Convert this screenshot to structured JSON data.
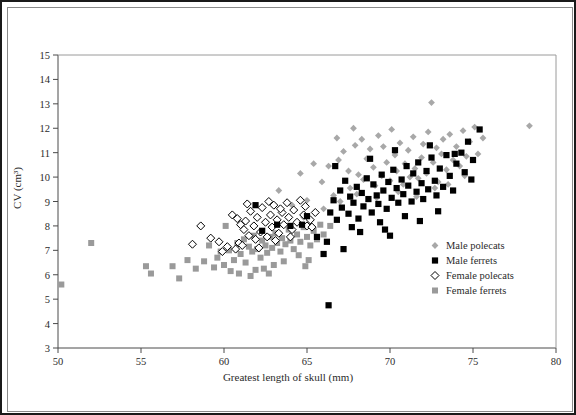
{
  "chart_data": {
    "type": "scatter",
    "title": "",
    "xlabel": "Greatest length of skull (mm)",
    "ylabel": "CV (cm³)",
    "xlim": [
      50,
      80
    ],
    "ylim": [
      3,
      15
    ],
    "xticks": [
      50,
      55,
      60,
      65,
      70,
      75,
      80
    ],
    "yticks": [
      3,
      4,
      5,
      6,
      7,
      8,
      9,
      10,
      11,
      12,
      13,
      14,
      15
    ],
    "grid": false,
    "legend_position": "right-lower",
    "series": [
      {
        "name": "Male polecats",
        "marker": "diamond-filled",
        "color": "#a8a8a8",
        "points": [
          [
            63.3,
            9.45
          ],
          [
            64.6,
            10.15
          ],
          [
            65.4,
            10.55
          ],
          [
            64.1,
            8.85
          ],
          [
            65.0,
            9.05
          ],
          [
            65.9,
            9.8
          ],
          [
            66.3,
            10.45
          ],
          [
            66.6,
            9.25
          ],
          [
            66.9,
            10.7
          ],
          [
            67.2,
            11.05
          ],
          [
            67.5,
            10.25
          ],
          [
            67.6,
            9.55
          ],
          [
            67.9,
            11.3
          ],
          [
            68.1,
            10.1
          ],
          [
            68.3,
            11.55
          ],
          [
            68.4,
            9.9
          ],
          [
            68.6,
            10.75
          ],
          [
            68.8,
            11.15
          ],
          [
            69.0,
            10.4
          ],
          [
            69.1,
            9.65
          ],
          [
            69.3,
            11.7
          ],
          [
            69.5,
            10.05
          ],
          [
            69.6,
            11.25
          ],
          [
            69.8,
            10.6
          ],
          [
            70.0,
            9.85
          ],
          [
            70.1,
            11.95
          ],
          [
            70.3,
            10.9
          ],
          [
            70.4,
            10.25
          ],
          [
            70.6,
            11.4
          ],
          [
            70.8,
            9.7
          ],
          [
            70.9,
            10.55
          ],
          [
            71.1,
            11.1
          ],
          [
            71.2,
            10.0
          ],
          [
            71.4,
            11.65
          ],
          [
            71.5,
            10.35
          ],
          [
            71.7,
            9.95
          ],
          [
            71.9,
            10.8
          ],
          [
            72.0,
            11.35
          ],
          [
            72.2,
            10.15
          ],
          [
            72.3,
            11.85
          ],
          [
            72.5,
            13.05
          ],
          [
            72.6,
            10.6
          ],
          [
            72.8,
            11.2
          ],
          [
            72.9,
            9.8
          ],
          [
            73.1,
            10.95
          ],
          [
            73.2,
            11.55
          ],
          [
            73.4,
            10.3
          ],
          [
            73.6,
            11.75
          ],
          [
            73.8,
            10.7
          ],
          [
            74.0,
            11.25
          ],
          [
            74.2,
            10.45
          ],
          [
            74.4,
            11.9
          ],
          [
            74.6,
            10.85
          ],
          [
            74.8,
            11.45
          ],
          [
            75.1,
            12.05
          ],
          [
            75.3,
            10.95
          ],
          [
            75.6,
            11.6
          ],
          [
            78.4,
            12.1
          ],
          [
            66.0,
            8.7
          ],
          [
            64.8,
            8.35
          ],
          [
            67.0,
            9.0
          ],
          [
            68.0,
            9.3
          ],
          [
            69.2,
            9.15
          ],
          [
            70.5,
            9.4
          ],
          [
            71.6,
            9.2
          ],
          [
            72.7,
            9.55
          ],
          [
            73.5,
            9.7
          ],
          [
            74.5,
            10.05
          ],
          [
            66.8,
            11.6
          ],
          [
            67.8,
            12.0
          ]
        ]
      },
      {
        "name": "Male ferrets",
        "marker": "square-filled",
        "color": "#000000",
        "points": [
          [
            61.9,
            8.85
          ],
          [
            63.2,
            8.05
          ],
          [
            64.0,
            8.0
          ],
          [
            64.7,
            8.05
          ],
          [
            65.0,
            8.4
          ],
          [
            62.3,
            7.8
          ],
          [
            66.3,
            4.75
          ],
          [
            66.2,
            7.35
          ],
          [
            66.4,
            8.55
          ],
          [
            66.6,
            9.05
          ],
          [
            66.8,
            8.25
          ],
          [
            67.0,
            9.45
          ],
          [
            67.1,
            8.75
          ],
          [
            67.3,
            9.85
          ],
          [
            67.5,
            8.5
          ],
          [
            67.6,
            9.2
          ],
          [
            67.8,
            8.95
          ],
          [
            68.0,
            9.6
          ],
          [
            68.1,
            8.3
          ],
          [
            68.3,
            9.35
          ],
          [
            68.4,
            8.8
          ],
          [
            68.6,
            9.95
          ],
          [
            68.7,
            9.1
          ],
          [
            68.9,
            8.55
          ],
          [
            69.0,
            9.7
          ],
          [
            69.2,
            9.25
          ],
          [
            69.3,
            8.9
          ],
          [
            69.5,
            10.1
          ],
          [
            69.6,
            9.45
          ],
          [
            69.8,
            8.7
          ],
          [
            69.9,
            9.8
          ],
          [
            70.1,
            9.15
          ],
          [
            70.2,
            10.3
          ],
          [
            70.4,
            9.55
          ],
          [
            70.5,
            8.95
          ],
          [
            70.7,
            9.9
          ],
          [
            70.8,
            9.3
          ],
          [
            71.0,
            10.45
          ],
          [
            71.1,
            9.65
          ],
          [
            71.3,
            9.0
          ],
          [
            71.4,
            10.15
          ],
          [
            71.6,
            9.4
          ],
          [
            71.7,
            10.6
          ],
          [
            71.9,
            9.75
          ],
          [
            72.0,
            9.1
          ],
          [
            72.2,
            10.25
          ],
          [
            72.3,
            9.5
          ],
          [
            72.5,
            10.8
          ],
          [
            72.7,
            9.85
          ],
          [
            72.8,
            9.25
          ],
          [
            73.0,
            10.35
          ],
          [
            73.2,
            9.6
          ],
          [
            73.4,
            10.9
          ],
          [
            73.6,
            10.05
          ],
          [
            73.8,
            9.45
          ],
          [
            74.0,
            10.55
          ],
          [
            74.3,
            11.0
          ],
          [
            74.5,
            10.2
          ],
          [
            74.7,
            11.45
          ],
          [
            75.0,
            10.7
          ],
          [
            75.4,
            11.95
          ],
          [
            65.6,
            7.55
          ],
          [
            66.0,
            6.85
          ],
          [
            67.2,
            7.05
          ],
          [
            68.2,
            7.75
          ],
          [
            69.4,
            8.15
          ],
          [
            70.0,
            7.6
          ],
          [
            70.9,
            8.4
          ],
          [
            71.8,
            8.2
          ],
          [
            72.9,
            8.6
          ],
          [
            66.7,
            10.45
          ],
          [
            68.8,
            10.75
          ],
          [
            70.3,
            11.1
          ],
          [
            72.4,
            11.3
          ],
          [
            74.9,
            9.9
          ],
          [
            67.7,
            7.95
          ],
          [
            69.7,
            7.85
          ],
          [
            73.9,
            10.95
          ]
        ]
      },
      {
        "name": "Female polecats",
        "marker": "diamond-open",
        "color": "#000000",
        "points": [
          [
            58.1,
            7.25
          ],
          [
            59.7,
            7.35
          ],
          [
            60.5,
            8.45
          ],
          [
            60.9,
            7.3
          ],
          [
            61.0,
            8.05
          ],
          [
            61.2,
            7.85
          ],
          [
            61.3,
            8.2
          ],
          [
            61.5,
            7.6
          ],
          [
            61.6,
            8.6
          ],
          [
            61.8,
            8.0
          ],
          [
            61.9,
            7.45
          ],
          [
            62.0,
            8.35
          ],
          [
            62.2,
            7.75
          ],
          [
            62.3,
            8.75
          ],
          [
            62.5,
            8.15
          ],
          [
            62.6,
            7.55
          ],
          [
            62.8,
            8.45
          ],
          [
            62.9,
            7.95
          ],
          [
            63.0,
            8.85
          ],
          [
            63.2,
            8.25
          ],
          [
            63.3,
            7.7
          ],
          [
            63.5,
            8.55
          ],
          [
            63.6,
            8.05
          ],
          [
            63.8,
            8.95
          ],
          [
            63.9,
            8.35
          ],
          [
            64.1,
            7.85
          ],
          [
            64.2,
            8.65
          ],
          [
            64.4,
            8.15
          ],
          [
            64.6,
            9.05
          ],
          [
            64.8,
            8.45
          ],
          [
            65.0,
            8.0
          ],
          [
            60.2,
            7.15
          ],
          [
            59.9,
            6.95
          ],
          [
            60.7,
            7.05
          ],
          [
            61.1,
            7.2
          ],
          [
            62.1,
            7.1
          ],
          [
            63.1,
            7.4
          ],
          [
            64.0,
            7.55
          ],
          [
            65.2,
            8.25
          ],
          [
            65.5,
            8.55
          ],
          [
            62.7,
            9.0
          ],
          [
            63.4,
            8.7
          ],
          [
            61.4,
            8.9
          ],
          [
            60.8,
            8.3
          ],
          [
            64.9,
            8.8
          ],
          [
            65.3,
            7.95
          ],
          [
            58.6,
            8.0
          ],
          [
            59.2,
            7.5
          ]
        ]
      },
      {
        "name": "Female ferrets",
        "marker": "square-filled-gray",
        "color": "#9a9a9a",
        "points": [
          [
            50.2,
            5.6
          ],
          [
            52.0,
            7.3
          ],
          [
            55.3,
            6.35
          ],
          [
            55.6,
            6.05
          ],
          [
            56.9,
            6.35
          ],
          [
            57.3,
            5.85
          ],
          [
            58.8,
            6.55
          ],
          [
            59.4,
            6.3
          ],
          [
            59.8,
            6.95
          ],
          [
            60.0,
            6.4
          ],
          [
            60.3,
            7.0
          ],
          [
            60.6,
            6.6
          ],
          [
            60.8,
            7.3
          ],
          [
            61.0,
            6.85
          ],
          [
            61.2,
            7.45
          ],
          [
            61.3,
            6.5
          ],
          [
            61.5,
            7.15
          ],
          [
            61.7,
            6.95
          ],
          [
            61.8,
            7.6
          ],
          [
            62.0,
            7.05
          ],
          [
            62.2,
            6.7
          ],
          [
            62.3,
            7.4
          ],
          [
            62.5,
            7.2
          ],
          [
            62.6,
            6.9
          ],
          [
            62.8,
            7.55
          ],
          [
            62.9,
            7.1
          ],
          [
            63.1,
            7.7
          ],
          [
            63.2,
            7.3
          ],
          [
            63.4,
            6.95
          ],
          [
            63.5,
            7.5
          ],
          [
            63.7,
            7.25
          ],
          [
            63.9,
            7.85
          ],
          [
            64.0,
            7.4
          ],
          [
            64.2,
            7.05
          ],
          [
            64.4,
            7.65
          ],
          [
            64.6,
            7.35
          ],
          [
            64.8,
            7.95
          ],
          [
            65.0,
            7.55
          ],
          [
            65.2,
            7.2
          ],
          [
            65.4,
            7.8
          ],
          [
            65.6,
            7.45
          ],
          [
            65.8,
            8.05
          ],
          [
            60.1,
            8.0
          ],
          [
            61.6,
            5.95
          ],
          [
            62.4,
            6.25
          ],
          [
            59.1,
            7.2
          ],
          [
            60.4,
            6.15
          ],
          [
            63.6,
            6.55
          ],
          [
            64.5,
            6.8
          ],
          [
            65.1,
            6.6
          ],
          [
            58.3,
            6.25
          ],
          [
            57.8,
            6.6
          ],
          [
            61.9,
            6.2
          ],
          [
            63.0,
            6.4
          ],
          [
            66.0,
            7.65
          ],
          [
            66.4,
            8.0
          ],
          [
            59.6,
            6.7
          ],
          [
            62.7,
            6.05
          ],
          [
            64.9,
            6.35
          ],
          [
            60.9,
            6.05
          ]
        ]
      }
    ]
  },
  "legend": {
    "entries": [
      {
        "label": "Male polecats",
        "marker": "diamond-filled"
      },
      {
        "label": "Male ferrets",
        "marker": "square-filled"
      },
      {
        "label": "Female polecats",
        "marker": "diamond-open"
      },
      {
        "label": "Female ferrets",
        "marker": "square-filled-gray"
      }
    ]
  }
}
